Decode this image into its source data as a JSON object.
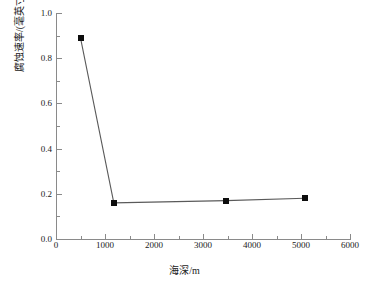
{
  "chart_data": {
    "type": "line",
    "title": "",
    "xlabel": "海深/m",
    "ylabel": "腐蚀速率/(毫英寸/年)",
    "xlim": [
      0,
      6000
    ],
    "ylim": [
      0.0,
      1.0
    ],
    "grid": false,
    "legend": null,
    "marker": "filled-square",
    "marker_color": "#0d0d0d",
    "line_color": "#5a5a5a",
    "axis_color": "#8a8a8a",
    "background": "#ffffff",
    "x": [
      500,
      1180,
      3470,
      5080
    ],
    "values": [
      0.89,
      0.16,
      0.17,
      0.18
    ],
    "points": [
      {
        "x": 500,
        "y": 0.89
      },
      {
        "x": 1180,
        "y": 0.16
      },
      {
        "x": 3470,
        "y": 0.17
      },
      {
        "x": 5080,
        "y": 0.18
      }
    ],
    "xticks": [
      0,
      1000,
      2000,
      3000,
      4000,
      5000,
      6000
    ],
    "xtick_labels": [
      "0",
      "1000",
      "2000",
      "3000",
      "4000",
      "5000",
      "6000"
    ],
    "xminor_ticks": [
      500,
      1500,
      2500,
      3500,
      4500,
      5500
    ],
    "yticks": [
      0.0,
      0.2,
      0.4,
      0.6,
      0.8,
      1.0
    ],
    "ytick_labels": [
      "0.0",
      "0.2",
      "0.4",
      "0.6",
      "0.8",
      "1.0"
    ],
    "yminor_ticks": [
      0.1,
      0.3,
      0.5,
      0.7,
      0.9
    ]
  }
}
